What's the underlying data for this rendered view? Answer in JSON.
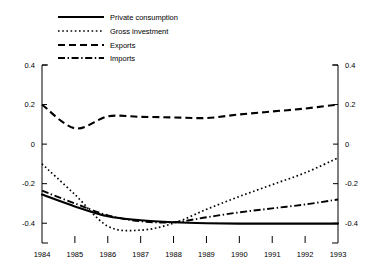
{
  "chart_data": {
    "type": "line",
    "title": "",
    "subtitle": "",
    "xlabel": "",
    "ylabel": "",
    "x": [
      1984,
      1985,
      1986,
      1987,
      1988,
      1989,
      1990,
      1991,
      1992,
      1993
    ],
    "xticklabels": [
      "1984",
      "1985",
      "1986",
      "1987",
      "1988",
      "1989",
      "1990",
      "1991",
      "1992",
      "1993"
    ],
    "yticklabels": [
      "0.4",
      "0.2",
      "0",
      "-0.2",
      "-0.4"
    ],
    "ytickvalues": [
      0.4,
      0.2,
      0,
      -0.2,
      -0.4
    ],
    "ylim": [
      -0.5,
      0.4
    ],
    "xlim": [
      1984,
      1993
    ],
    "grid": false,
    "legend_position": "top-left",
    "right_axis_mirrored": true,
    "series": [
      {
        "name": "Private consumption",
        "style": "solid",
        "values": [
          -0.255,
          -0.315,
          -0.365,
          -0.385,
          -0.395,
          -0.4,
          -0.402,
          -0.402,
          -0.402,
          -0.402
        ]
      },
      {
        "name": "Gross investment",
        "style": "dotted",
        "values": [
          -0.1,
          -0.255,
          -0.415,
          -0.435,
          -0.4,
          -0.33,
          -0.265,
          -0.205,
          -0.145,
          -0.07
        ]
      },
      {
        "name": "Exports",
        "style": "dashed",
        "values": [
          0.2,
          0.08,
          0.14,
          0.138,
          0.135,
          0.132,
          0.15,
          0.165,
          0.18,
          0.2
        ]
      },
      {
        "name": "Imports",
        "style": "dashdot",
        "values": [
          -0.235,
          -0.3,
          -0.36,
          -0.39,
          -0.395,
          -0.37,
          -0.345,
          -0.325,
          -0.305,
          -0.28
        ]
      }
    ]
  }
}
